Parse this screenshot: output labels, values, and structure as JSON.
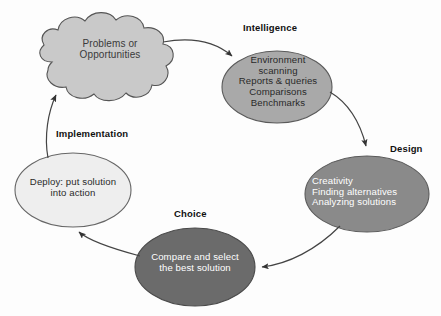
{
  "diagram": {
    "type": "cycle-flow",
    "background_color": "#fdfdfd",
    "stages": [
      {
        "id": "problems",
        "shape": "cloud",
        "label": "",
        "body": "Problems or\nOpportunities",
        "fill": "#c9c9c9",
        "stroke": "#555555",
        "text_color": "#3a3a3a"
      },
      {
        "id": "intelligence",
        "shape": "ellipse",
        "label": "Intelligence",
        "body": "Environment\nscanning\nReports & queries\nComparisons\nBenchmarks",
        "fill": "#a9a9a9",
        "stroke": "#5a5a5a",
        "text_color": "#2a2a2a"
      },
      {
        "id": "design",
        "shape": "ellipse",
        "label": "Design",
        "body": "Creativity\nFinding alternatives\nAnalyzing solutions",
        "fill": "#8a8a8a",
        "stroke": "#5a5a5a",
        "text_color": "#ffffff"
      },
      {
        "id": "choice",
        "shape": "ellipse",
        "label": "Choice",
        "body": "Compare and select\nthe best solution",
        "fill": "#6b6b6b",
        "stroke": "#4a4a4a",
        "text_color": "#ffffff"
      },
      {
        "id": "implementation",
        "shape": "ellipse",
        "label": "Implementation",
        "body": "Deploy: put solution\ninto action",
        "fill": "#eeeeee",
        "stroke": "#666666",
        "text_color": "#2a2a2a"
      }
    ],
    "connectors": [
      {
        "id": "problems-to-intelligence",
        "from": "problems",
        "to": "intelligence",
        "style": "curved-arrow"
      },
      {
        "id": "intelligence-to-design",
        "from": "intelligence",
        "to": "design",
        "style": "curved-arrow"
      },
      {
        "id": "design-to-choice",
        "from": "design",
        "to": "choice",
        "style": "curved-arrow"
      },
      {
        "id": "choice-to-implementation",
        "from": "choice",
        "to": "implementation",
        "style": "curved-arrow"
      },
      {
        "id": "implementation-to-problems",
        "from": "implementation",
        "to": "problems",
        "style": "curved-arrow"
      }
    ],
    "arrow_color": "#444444"
  }
}
